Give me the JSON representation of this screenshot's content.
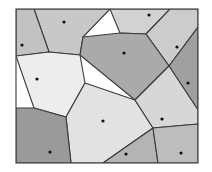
{
  "figure": {
    "frame": {
      "x": 16,
      "y": 9,
      "width": 182,
      "height": 154
    },
    "background_color": "#ffffff",
    "edge_color": "#3a3a3a",
    "frame_color": "#4a4a4a",
    "seed_color": "#111111",
    "seed_radius": 1.6
  },
  "chart_data": {
    "type": "diagram",
    "subtype": "voronoi",
    "xlabel": "",
    "ylabel": "",
    "xlim": [
      16,
      198
    ],
    "ylim": [
      9,
      163
    ],
    "grid": false,
    "legend": false,
    "site_count": 12,
    "sites": [
      {
        "id": 1,
        "label": "site-1",
        "x": 64,
        "y": 22,
        "fill": "#c8c8c8"
      },
      {
        "id": 2,
        "label": "site-2",
        "x": 149,
        "y": 15,
        "fill": "#d2d2d2"
      },
      {
        "id": 3,
        "label": "site-3",
        "x": 22,
        "y": 45,
        "fill": "#c2c2c2"
      },
      {
        "id": 4,
        "label": "site-4",
        "x": 177,
        "y": 47,
        "fill": "#cccccc"
      },
      {
        "id": 5,
        "label": "site-5",
        "x": 124,
        "y": 53,
        "fill": "#aaaaaa"
      },
      {
        "id": 6,
        "label": "site-6",
        "x": 37,
        "y": 79,
        "fill": "#ededed"
      },
      {
        "id": 7,
        "label": "site-7",
        "x": 188,
        "y": 83,
        "fill": "#a0a0a0"
      },
      {
        "id": 8,
        "label": "site-8",
        "x": 103,
        "y": 121,
        "fill": "#e2e2e2"
      },
      {
        "id": 9,
        "label": "site-9",
        "x": 162,
        "y": 119,
        "fill": "#d7d7d7"
      },
      {
        "id": 10,
        "label": "site-10",
        "x": 50,
        "y": 152,
        "fill": "#9a9a9a"
      },
      {
        "id": 11,
        "label": "site-11",
        "x": 126,
        "y": 154,
        "fill": "#b4b4b4"
      },
      {
        "id": 12,
        "label": "site-12",
        "x": 181,
        "y": 153,
        "fill": "#bdbdbd"
      }
    ],
    "cells": [
      {
        "site_id": 1,
        "label": "cell-1",
        "fill": "#c8c8c8",
        "points": "34,9 110,9 83,37 80,55 49,52"
      },
      {
        "site_id": 2,
        "label": "cell-2",
        "fill": "#d2d2d2",
        "points": "110,9 170,9 146,34 120,33"
      },
      {
        "site_id": 3,
        "label": "cell-3",
        "fill": "#c2c2c2",
        "points": "16,9 34,9 49,52 16,56"
      },
      {
        "site_id": 4,
        "label": "cell-4",
        "fill": "#cccccc",
        "points": "170,9 198,9 198,27 169,66 146,34"
      },
      {
        "site_id": 5,
        "label": "cell-5",
        "fill": "#aaaaaa",
        "points": "83,37 120,33 146,34 169,66 135,100 80,55"
      },
      {
        "site_id": 6,
        "label": "cell-6",
        "fill": "#ededed",
        "points": "16,56 49,52 80,55 85,83 66,117 34,108"
      },
      {
        "site_id": 7,
        "label": "cell-7",
        "fill": "#a0a0a0",
        "points": "198,27 198,110 169,66"
      },
      {
        "site_id": 8,
        "label": "cell-8",
        "fill": "#e2e2e2",
        "points": "85,83 135,100 153,128 103,163 71,163 66,117"
      },
      {
        "site_id": 9,
        "label": "cell-9",
        "fill": "#d7d7d7",
        "points": "135,100 169,66 198,110 198,124 153,128"
      },
      {
        "site_id": 10,
        "label": "cell-10",
        "fill": "#9a9a9a",
        "points": "16,108 34,108 66,117 71,163 16,163"
      },
      {
        "site_id": 11,
        "label": "cell-11",
        "fill": "#b4b4b4",
        "points": "103,163 153,128 158,163"
      },
      {
        "site_id": 12,
        "label": "cell-12",
        "fill": "#bdbdbd",
        "points": "153,128 198,124 198,163 158,163"
      }
    ]
  }
}
